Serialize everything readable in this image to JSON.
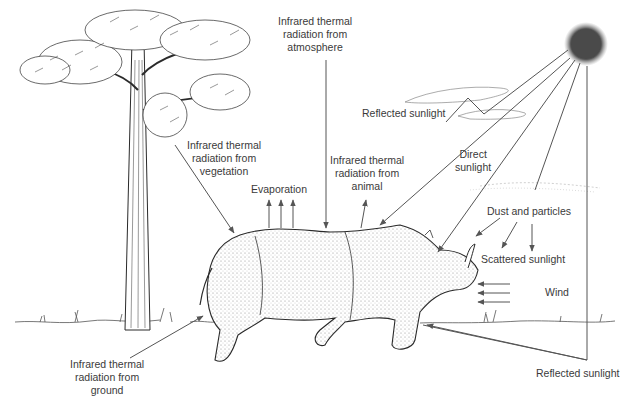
{
  "labels": {
    "atmosphere": [
      "Infrared thermal",
      "radiation from",
      "atmosphere"
    ],
    "vegetation": [
      "Infrared thermal",
      "radiation from",
      "vegetation"
    ],
    "animal": [
      "Infrared thermal",
      "radiation from",
      "animal"
    ],
    "ground": [
      "Infrared thermal",
      "radiation from",
      "ground"
    ],
    "evaporation": "Evaporation",
    "reflected_sunlight_cloud": "Reflected sunlight",
    "direct_sunlight": [
      "Direct",
      "sunlight"
    ],
    "dust": "Dust and particles",
    "scattered": "Scattered sunlight",
    "wind": "Wind",
    "reflected_sunlight_ground": "Reflected sunlight"
  },
  "colors": {
    "line": "#555555",
    "sun": "#4a4a4a",
    "ink": "#2a2a2a",
    "text": "#3a3a3a"
  },
  "elements": [
    "tree",
    "rhinoceros",
    "sun",
    "clouds",
    "ground-grass"
  ]
}
